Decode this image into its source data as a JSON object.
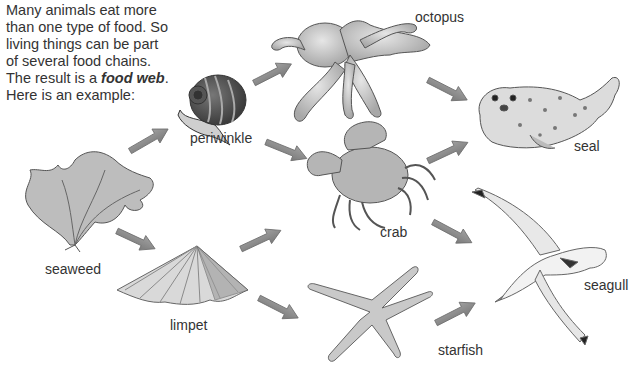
{
  "intro": {
    "lines": [
      "Many animals eat more",
      "than one type of food. So",
      "living things can be part",
      "of several food chains."
    ],
    "result_prefix": "The result is a ",
    "result_term": "food web",
    "result_suffix": ".",
    "example_line": "Here is an example:"
  },
  "organisms": {
    "seaweed": "seaweed",
    "periwinkle": "periwinkle",
    "limpet": "limpet",
    "octopus": "octopus",
    "crab": "crab",
    "starfish": "starfish",
    "seal": "seal",
    "seagull": "seagull"
  },
  "links": [
    {
      "from": "seaweed",
      "to": "periwinkle"
    },
    {
      "from": "seaweed",
      "to": "limpet"
    },
    {
      "from": "periwinkle",
      "to": "octopus"
    },
    {
      "from": "periwinkle",
      "to": "crab"
    },
    {
      "from": "limpet",
      "to": "crab"
    },
    {
      "from": "limpet",
      "to": "starfish"
    },
    {
      "from": "octopus",
      "to": "seal"
    },
    {
      "from": "crab",
      "to": "seal"
    },
    {
      "from": "crab",
      "to": "seagull"
    },
    {
      "from": "starfish",
      "to": "seagull"
    }
  ],
  "colors": {
    "arrow": "#8a8a8a",
    "arrow_edge": "#6e6e6e",
    "text": "#333333"
  }
}
